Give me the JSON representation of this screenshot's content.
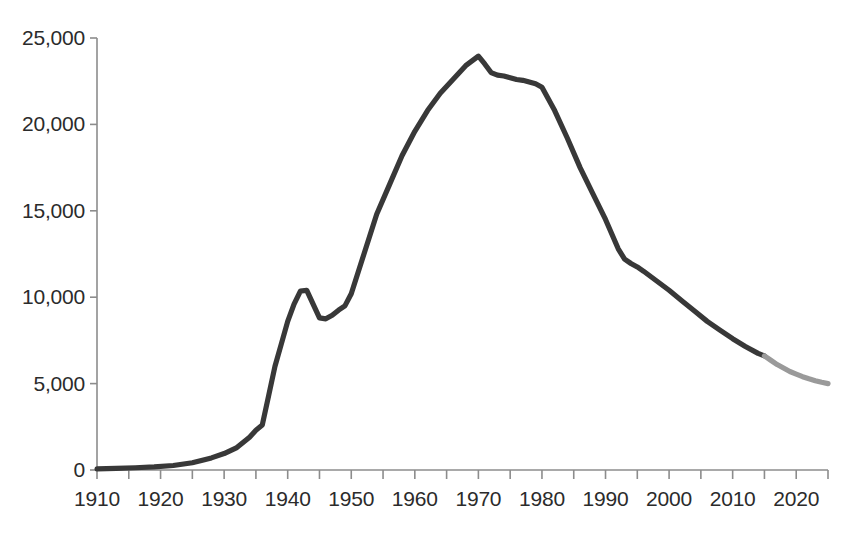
{
  "chart_data": {
    "type": "line",
    "title": "",
    "subtitle": "",
    "xlabel": "",
    "ylabel": "",
    "xlim": [
      1910,
      2025
    ],
    "ylim": [
      0,
      25000
    ],
    "grid": false,
    "legend": null,
    "y_ticks": [
      0,
      5000,
      10000,
      15000,
      20000,
      25000
    ],
    "y_tick_labels": [
      "0",
      "5,000",
      "10,000",
      "15,000",
      "20,000",
      "25,000"
    ],
    "x_ticks": [
      1910,
      1920,
      1930,
      1940,
      1950,
      1960,
      1970,
      1980,
      1990,
      2000,
      2010,
      2020
    ],
    "x_tick_labels": [
      "1910",
      "1920",
      "1930",
      "1940",
      "1950",
      "1960",
      "1970",
      "1980",
      "1990",
      "2000",
      "2010",
      "2020"
    ],
    "x_minor_tick_interval": 5,
    "colors": {
      "line_actual": "#383838",
      "line_projected": "#9a9a9a",
      "axis": "#8c8c8c",
      "text": "#2b2b2b",
      "background": "#ffffff"
    },
    "series": [
      {
        "name": "Actual",
        "style": "solid",
        "color": "#383838",
        "x": [
          1910,
          1913,
          1916,
          1919,
          1922,
          1925,
          1928,
          1930,
          1932,
          1934,
          1935,
          1936,
          1937,
          1938,
          1939,
          1940,
          1941,
          1942,
          1943,
          1944,
          1945,
          1946,
          1947,
          1948,
          1949,
          1950,
          1952,
          1954,
          1956,
          1958,
          1960,
          1962,
          1964,
          1966,
          1968,
          1970,
          1971,
          1972,
          1973,
          1974,
          1975,
          1976,
          1977,
          1978,
          1979,
          1980,
          1982,
          1984,
          1986,
          1988,
          1990,
          1992,
          1993,
          1994,
          1995,
          1996,
          1998,
          2000,
          2002,
          2004,
          2006,
          2008,
          2010,
          2012,
          2014,
          2015
        ],
        "y": [
          60,
          90,
          130,
          180,
          260,
          420,
          700,
          950,
          1300,
          1900,
          2300,
          2600,
          4300,
          6000,
          7300,
          8600,
          9600,
          10350,
          10400,
          9600,
          8800,
          8750,
          8950,
          9250,
          9500,
          10200,
          12500,
          14800,
          16500,
          18200,
          19600,
          20800,
          21800,
          22600,
          23400,
          23950,
          23500,
          23000,
          22850,
          22800,
          22700,
          22600,
          22550,
          22450,
          22350,
          22150,
          20800,
          19200,
          17500,
          16000,
          14500,
          12800,
          12200,
          11950,
          11750,
          11500,
          10950,
          10400,
          9800,
          9200,
          8600,
          8100,
          7600,
          7150,
          6750,
          6600
        ]
      },
      {
        "name": "Projected",
        "style": "solid",
        "color": "#9a9a9a",
        "x": [
          2015,
          2016,
          2017,
          2018,
          2019,
          2020,
          2021,
          2022,
          2023,
          2024,
          2025
        ],
        "y": [
          6600,
          6350,
          6100,
          5900,
          5700,
          5550,
          5400,
          5280,
          5170,
          5080,
          5000
        ]
      }
    ]
  }
}
